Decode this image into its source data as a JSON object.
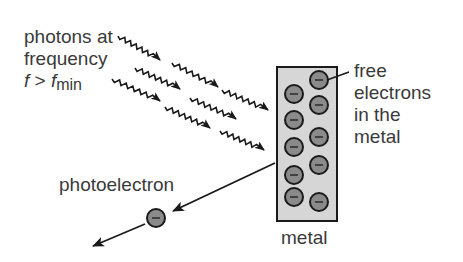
{
  "diagram": {
    "labels": {
      "photons_line1": "photons at",
      "photons_line2": "frequency",
      "condition_f": "f",
      "condition_op": " > ",
      "condition_fmin_base": "f",
      "condition_fmin_sub": "min",
      "free_electrons_line1": "free",
      "free_electrons_line2": "electrons",
      "free_electrons_line3": "in the",
      "free_electrons_line4": "metal",
      "photoelectron": "photoelectron",
      "metal": "metal"
    },
    "colors": {
      "text": "#3a3a3a",
      "stroke": "#1a1a1a",
      "metal_fill": "#d6d6d6",
      "electron_fill": "#8a8a8a"
    },
    "photon_count": 8,
    "free_electron_count": 10,
    "electron_symbol": "−"
  }
}
